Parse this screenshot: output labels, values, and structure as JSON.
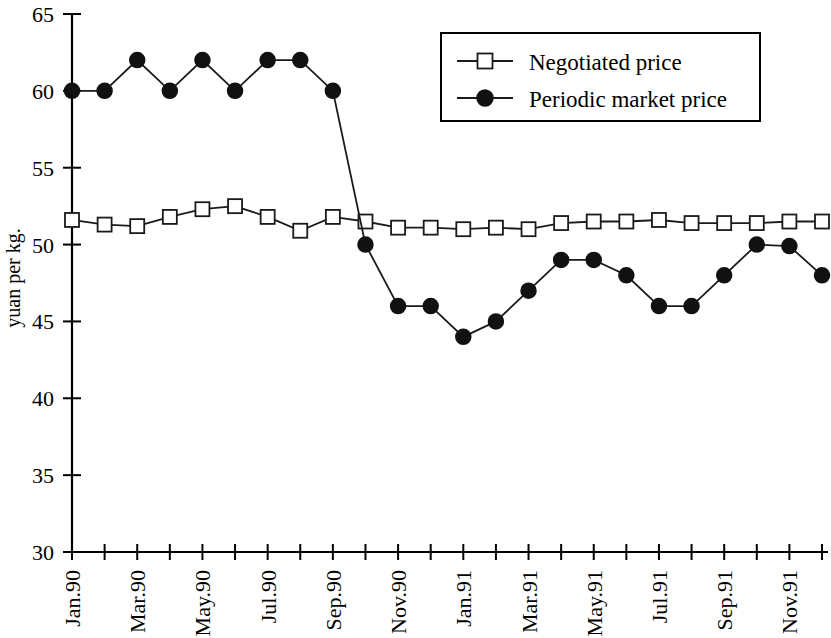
{
  "chart_data": {
    "type": "line",
    "title": "",
    "xlabel": "",
    "ylabel": "yuan per kg.",
    "ylim": [
      30,
      65
    ],
    "yticks": [
      30,
      35,
      40,
      45,
      50,
      55,
      60,
      65
    ],
    "ytick_labels": [
      "30",
      "35",
      "40",
      "45",
      "50",
      "55",
      "60",
      "65"
    ],
    "grid": false,
    "legend_position": "top-right",
    "categories": [
      "Jan.90",
      "Feb.90",
      "Mar.90",
      "Apr.90",
      "May.90",
      "Jun.90",
      "Jul.90",
      "Aug.90",
      "Sep.90",
      "Oct.90",
      "Nov.90",
      "Dec.90",
      "Jan.91",
      "Feb.91",
      "Mar.91",
      "Apr.91",
      "May.91",
      "Jun.91",
      "Jul.91",
      "Aug.91",
      "Sep.91",
      "Oct.91",
      "Nov.91",
      "Dec.91"
    ],
    "xtick_labels_shown": [
      "Jan.90",
      "",
      "Mar.90",
      "",
      "May.90",
      "",
      "Jul.90",
      "",
      "Sep.90",
      "",
      "Nov.90",
      "",
      "Jan.91",
      "",
      "Mar.91",
      "",
      "May.91",
      "",
      "Jul.91",
      "",
      "Sep.91",
      "",
      "Nov.91",
      ""
    ],
    "series": [
      {
        "name": "Negotiated price",
        "marker": "open-square",
        "values": [
          51.6,
          51.3,
          51.2,
          51.8,
          52.3,
          52.5,
          51.8,
          50.9,
          51.8,
          51.5,
          51.1,
          51.1,
          51.0,
          51.1,
          51.0,
          51.4,
          51.5,
          51.5,
          51.6,
          51.4,
          51.4,
          51.4,
          51.5,
          51.5
        ]
      },
      {
        "name": "Periodic market price",
        "marker": "filled-circle",
        "values": [
          60,
          60,
          62,
          60,
          62,
          60,
          62,
          62,
          60,
          50,
          46,
          46,
          44,
          45,
          47,
          49,
          49,
          48,
          46,
          46,
          48,
          50,
          49.9,
          48
        ]
      }
    ]
  },
  "legend": {
    "entries": [
      {
        "label": "Negotiated price",
        "marker": "open-square"
      },
      {
        "label": "Periodic market price",
        "marker": "filled-circle"
      }
    ]
  },
  "colors": {
    "ink": "#000000",
    "line": "#1a1a1a",
    "marker_fill_open": "#ffffff",
    "marker_fill_closed": "#111111",
    "background": "#ffffff"
  }
}
